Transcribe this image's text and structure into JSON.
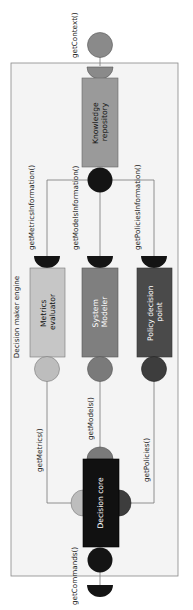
{
  "diagram": {
    "container": {
      "label": "Decision maker engine",
      "fill": "#f4f4f4",
      "stroke": "#888888"
    },
    "components": [
      {
        "id": "knowledge",
        "lines": [
          "Knowledge",
          "repository"
        ],
        "fill": "#a6a6a6",
        "text_color": "#111111"
      },
      {
        "id": "metrics",
        "lines": [
          "Metrics",
          "evaluator"
        ],
        "fill": "#c6c6c6",
        "text_color": "#111111"
      },
      {
        "id": "system",
        "lines": [
          "System",
          "Modeler"
        ],
        "fill": "#7f7f7f",
        "text_color": "#ffffff"
      },
      {
        "id": "policy",
        "lines": [
          "Policy decision",
          "point"
        ],
        "fill": "#4a4a4a",
        "text_color": "#ffffff"
      },
      {
        "id": "core",
        "lines": [
          "Decision core"
        ],
        "fill": "#111111",
        "text_color": "#ffffff"
      }
    ],
    "interfaces": {
      "getContext": "getContext()",
      "getMetricsInformation": "getMetricsInformation()",
      "getModelsInformation": "getModelsInformation()",
      "getPoliciesInformation": "getPoliciesInformation()",
      "getMetrics": "getMetrics()",
      "getModels": "getModels()",
      "getPolicies": "getPolicies()",
      "getCommands": "getCommands()"
    },
    "colors": {
      "black": "#141414",
      "light": "#bdbdbd",
      "mid": "#7a7a7a",
      "dark": "#3d3d3d",
      "knowledge": "#9a9a9a",
      "line": "#777777"
    }
  }
}
